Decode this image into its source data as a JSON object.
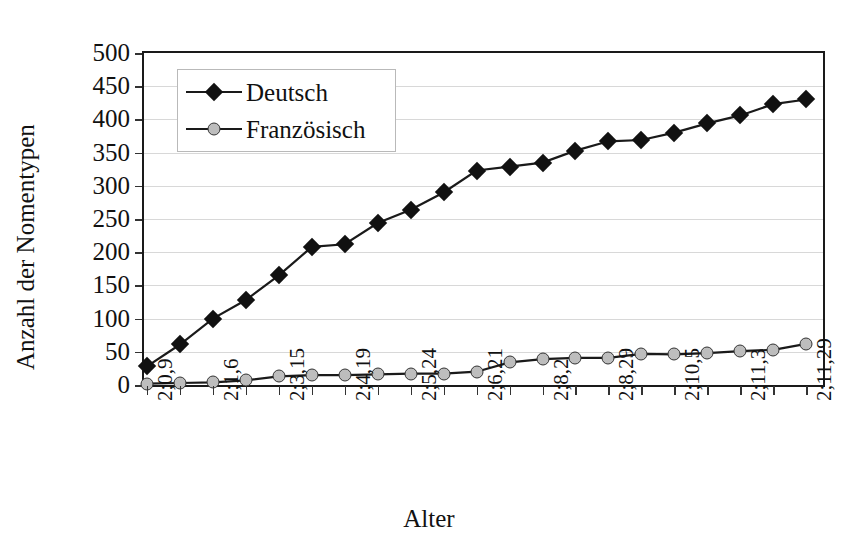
{
  "chart_data": {
    "type": "line",
    "title": "",
    "xlabel": "Alter",
    "ylabel": "Anzahl der Nomentypen",
    "ylim": [
      0,
      500
    ],
    "yticks": [
      0,
      50,
      100,
      150,
      200,
      250,
      300,
      350,
      400,
      450,
      500
    ],
    "grid": true,
    "legend_position": "top-left",
    "x_tick_labels_rotated": true,
    "categories": [
      "2;0,9",
      "",
      "2;1,6",
      "",
      "2;3,15",
      "",
      "2;4,19",
      "",
      "2;5,24",
      "",
      "2;6,21",
      "",
      "2;8,2",
      "",
      "2;8,29",
      "",
      "2;10,5",
      "",
      "2;11,3",
      "",
      "2;11,29"
    ],
    "x_labeled_ticks": [
      "2;0,9",
      "2;1,6",
      "2;3,15",
      "2;4,19",
      "2;5,24",
      "2;6,21",
      "2;8,2",
      "2;8,29",
      "2;10,5",
      "2;11,3",
      "2;11,29"
    ],
    "series": [
      {
        "name": "Deutsch",
        "marker": "diamond",
        "marker_color": "#111111",
        "line_color": "#1a1a1a",
        "values": [
          28,
          61,
          100,
          128,
          165,
          208,
          212,
          244,
          264,
          290,
          323,
          329,
          335,
          353,
          367,
          369,
          380,
          394,
          406,
          423,
          430
        ]
      },
      {
        "name": "Französisch",
        "marker": "circle",
        "marker_color": "#bdbdbd",
        "line_color": "#1a1a1a",
        "values": [
          2,
          3,
          4,
          7,
          13,
          15,
          15,
          16,
          17,
          17,
          20,
          34,
          39,
          41,
          41,
          47,
          46,
          48,
          51,
          53,
          62
        ]
      }
    ]
  },
  "legend": {
    "items": [
      {
        "label": "Deutsch"
      },
      {
        "label": "Französisch"
      }
    ]
  },
  "axes": {
    "y_title": "Anzahl der Nomentypen",
    "x_title": "Alter"
  }
}
